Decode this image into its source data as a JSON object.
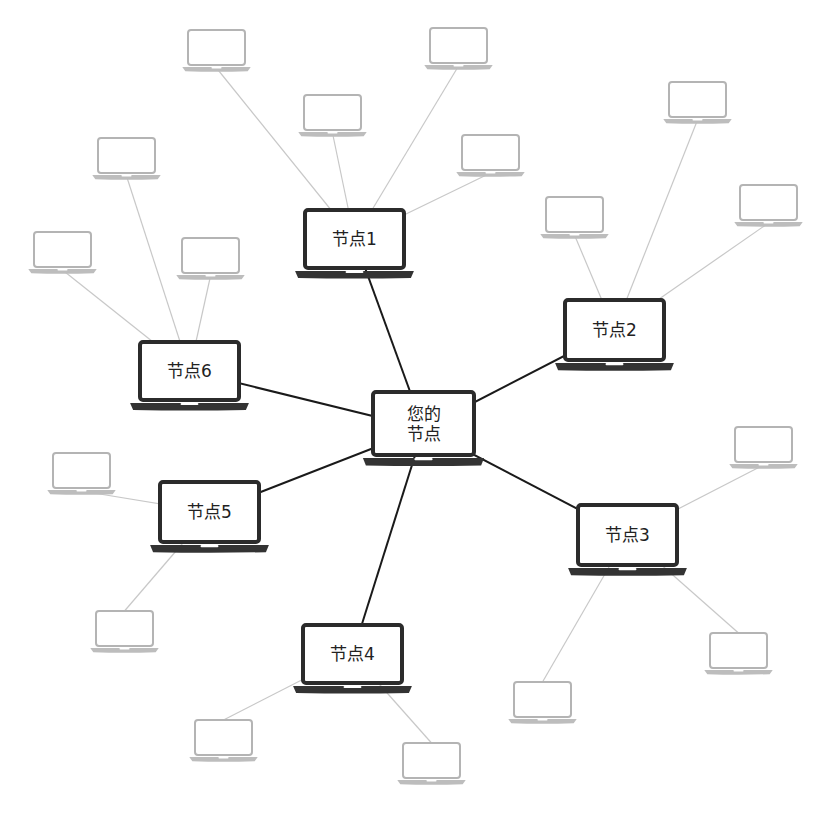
{
  "diagram": {
    "type": "p2p-network",
    "colors": {
      "main_stroke": "#2b2b2b",
      "peer_stroke": "#b4b4b4",
      "main_link": "#1a1a1a",
      "peer_link": "#c8c8c8",
      "background": "#ffffff"
    },
    "center": {
      "label_line1": "您的",
      "label_line2": "节点",
      "x": 373,
      "y": 392,
      "w": 101,
      "h": 63
    },
    "nodes": [
      {
        "id": "n1",
        "label": "节点1",
        "x": 305,
        "y": 210,
        "w": 99,
        "h": 58
      },
      {
        "id": "n2",
        "label": "节点2",
        "x": 565,
        "y": 300,
        "w": 99,
        "h": 60
      },
      {
        "id": "n3",
        "label": "节点3",
        "x": 578,
        "y": 505,
        "w": 99,
        "h": 60
      },
      {
        "id": "n4",
        "label": "节点4",
        "x": 303,
        "y": 625,
        "w": 99,
        "h": 58
      },
      {
        "id": "n5",
        "label": "节点5",
        "x": 160,
        "y": 482,
        "w": 99,
        "h": 60
      },
      {
        "id": "n6",
        "label": "节点6",
        "x": 140,
        "y": 342,
        "w": 99,
        "h": 58
      }
    ],
    "peers": [
      {
        "parent": "n1",
        "x": 188,
        "y": 30
      },
      {
        "parent": "n1",
        "x": 304,
        "y": 95
      },
      {
        "parent": "n1",
        "x": 430,
        "y": 28
      },
      {
        "parent": "n1",
        "x": 462,
        "y": 135
      },
      {
        "parent": "n2",
        "x": 669,
        "y": 82
      },
      {
        "parent": "n2",
        "x": 546,
        "y": 197
      },
      {
        "parent": "n2",
        "x": 740,
        "y": 185
      },
      {
        "parent": "n6",
        "x": 98,
        "y": 138
      },
      {
        "parent": "n6",
        "x": 34,
        "y": 232
      },
      {
        "parent": "n6",
        "x": 182,
        "y": 238
      },
      {
        "parent": "n3",
        "x": 735,
        "y": 427
      },
      {
        "parent": "n3",
        "x": 710,
        "y": 633
      },
      {
        "parent": "n3",
        "x": 514,
        "y": 682
      },
      {
        "parent": "n5",
        "x": 53,
        "y": 453
      },
      {
        "parent": "n5",
        "x": 96,
        "y": 611
      },
      {
        "parent": "n4",
        "x": 195,
        "y": 720
      },
      {
        "parent": "n4",
        "x": 403,
        "y": 743
      }
    ]
  }
}
